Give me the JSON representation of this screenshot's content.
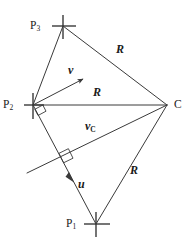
{
  "figure": {
    "type": "geometry-diagram",
    "width": 191,
    "height": 243,
    "background_color": "#ffffff",
    "stroke_color": "#3a3a3a",
    "text_color": "#1a1a1a"
  },
  "points": [
    {
      "id": "P3",
      "label": "P",
      "sub": "3",
      "x": 63,
      "y": 26,
      "label_x": 30,
      "label_y": 21,
      "marker": "cross"
    },
    {
      "id": "P2",
      "label": "P",
      "sub": "2",
      "x": 33,
      "y": 105,
      "label_x": 3,
      "label_y": 100,
      "marker": "cross"
    },
    {
      "id": "C",
      "label": "C",
      "sub": "",
      "x": 167,
      "y": 105,
      "label_x": 174,
      "label_y": 99,
      "marker": "none"
    },
    {
      "id": "P1",
      "label": "P",
      "sub": "1",
      "x": 96,
      "y": 224,
      "label_x": 66,
      "label_y": 218,
      "marker": "cross"
    }
  ],
  "segments": [
    {
      "name": "P3-C",
      "from": "P3",
      "to": "C",
      "x1": 63,
      "y1": 26,
      "x2": 167,
      "y2": 105
    },
    {
      "name": "P3-P2",
      "from": "P3",
      "to": "P2",
      "x1": 63,
      "y1": 26,
      "x2": 33,
      "y2": 105
    },
    {
      "name": "P2-C",
      "from": "P2",
      "to": "C",
      "x1": 33,
      "y1": 105,
      "x2": 167,
      "y2": 105
    },
    {
      "name": "P2-P1",
      "from": "P2",
      "to": "P1",
      "x1": 33,
      "y1": 105,
      "x2": 96,
      "y2": 224
    },
    {
      "name": "P1-C",
      "from": "P1",
      "to": "C",
      "x1": 96,
      "y1": 224,
      "x2": 167,
      "y2": 105
    },
    {
      "name": "vC-line",
      "from": "C",
      "to": "foot-extended",
      "x1": 167,
      "y1": 105,
      "x2": 27,
      "y2": 173
    }
  ],
  "vectors": [
    {
      "id": "v",
      "label": "v",
      "sub": "",
      "x1": 33,
      "y1": 105,
      "x2": 83,
      "y2": 79,
      "label_x": 68,
      "label_y": 65
    },
    {
      "id": "u",
      "label": "u",
      "sub": "",
      "x1": 33,
      "y1": 105,
      "x2": 73,
      "y2": 181,
      "label_x": 78,
      "label_y": 179
    },
    {
      "id": "vC",
      "label": "v",
      "sub": "C",
      "x1": 167,
      "y1": 105,
      "x2": 27,
      "y2": 173,
      "label_x": 85,
      "label_y": 121
    }
  ],
  "length_labels": [
    {
      "id": "R-top",
      "text": "R",
      "x": 116,
      "y": 44
    },
    {
      "id": "R-middle",
      "text": "R",
      "x": 93,
      "y": 87
    },
    {
      "id": "R-bottom",
      "text": "R",
      "x": 130,
      "y": 165
    }
  ],
  "right_angles": [
    {
      "id": "right-angle-at-P2",
      "x": 33,
      "y": 105,
      "note": "between P2-C and P2-P1"
    },
    {
      "id": "right-angle-at-foot",
      "x": 63,
      "y": 161,
      "note": "between vC line and P2-P1"
    }
  ]
}
